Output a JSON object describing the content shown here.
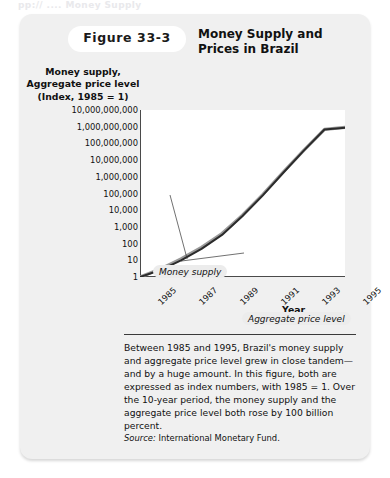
{
  "ghost_top_text": "pp:// ....  Money Supply",
  "header": {
    "figure_number": "Figure 33-3",
    "title": "Money Supply and Prices in Brazil"
  },
  "chart_data": {
    "type": "line",
    "title": "Money Supply and Prices in Brazil",
    "xlabel": "Year",
    "ylabel": "Money supply, Aggregate price level (Index, 1985 = 1)",
    "yscale": "log",
    "ylim": [
      1,
      10000000000
    ],
    "xlim": [
      1985,
      1995
    ],
    "grid": false,
    "legend": "annotated-inline",
    "ytick_labels": [
      "10,000,000,000",
      "1,000,000,000",
      "100,000,000",
      "10,000,000",
      "1,000,000",
      "100,000",
      "10,000",
      "1,000",
      "100",
      "10",
      "1"
    ],
    "ytick_values": [
      10000000000,
      1000000000,
      100000000,
      10000000,
      1000000,
      100000,
      10000,
      1000,
      100,
      10,
      1
    ],
    "xtick_labels": [
      "1985",
      "1987",
      "1989",
      "1991",
      "1993",
      "1995"
    ],
    "xtick_values": [
      1985,
      1987,
      1989,
      1991,
      1993,
      1995
    ],
    "x": [
      1985,
      1986,
      1987,
      1988,
      1989,
      1990,
      1991,
      1992,
      1993,
      1994,
      1995
    ],
    "series": [
      {
        "name": "Money supply",
        "color": "#9a9a9a",
        "values": [
          1,
          3,
          12,
          60,
          400,
          5000,
          90000,
          2000000,
          40000000,
          700000000,
          900000000
        ]
      },
      {
        "name": "Aggregate price level",
        "color": "#2b2b2b",
        "values": [
          1,
          2.6,
          10,
          48,
          330,
          4500,
          80000,
          1800000,
          38000000,
          680000000,
          880000000
        ]
      }
    ],
    "annotations": [
      {
        "text": "Money supply",
        "target_x": 1987.3,
        "target_y": 12
      },
      {
        "text": "Aggregate price level",
        "target_x": 1987.0,
        "target_y": 9
      }
    ]
  },
  "xaxis_title": "Year",
  "caption": {
    "body": "Between 1985 and 1995, Brazil's money supply and aggregate price level grew in close tandem—and by a huge amount. In this figure, both are expressed as index numbers, with 1985 = 1. Over the 10-year period, the money supply and the aggregate price level both rose by 100 billion percent.",
    "source_word": "Source:",
    "source_text": "International Monetary Fund."
  }
}
